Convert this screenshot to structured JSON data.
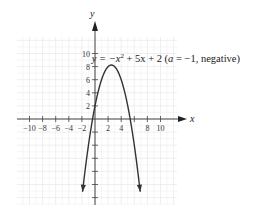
{
  "chart_data": {
    "type": "line",
    "title": "",
    "xlabel": "x",
    "ylabel": "y",
    "xlim": [
      -12,
      12
    ],
    "ylim": [
      -13,
      13
    ],
    "grid": true,
    "x_ticks": [
      -10,
      -8,
      -6,
      -4,
      -2,
      2,
      4,
      6,
      8,
      10
    ],
    "x_tick_labels": [
      "−10",
      "−8",
      "−6",
      "−4",
      "−2",
      "2",
      "4",
      "",
      "8",
      "10"
    ],
    "y_ticks": [
      2,
      4,
      6,
      8,
      10,
      -2,
      -4,
      -6,
      -8,
      -10,
      -12
    ],
    "y_tick_labels": [
      "2",
      "4",
      "6",
      "8",
      "10",
      "",
      "",
      "",
      "",
      "",
      ""
    ],
    "series": [
      {
        "name": "y = -x^2 + 5x + 2",
        "function": {
          "a": -1,
          "b": 5,
          "c": 2
        },
        "x_range": [
          -1.9,
          6.9
        ],
        "vertex": [
          2.5,
          8.25
        ],
        "color": "#333333"
      }
    ],
    "annotation": {
      "prefix": "y = −x",
      "exp": "2",
      "suffix": " + 5x + 2 (",
      "a_var": "a",
      "tail": " = −1, negative)",
      "near": [
        3,
        10
      ]
    }
  }
}
